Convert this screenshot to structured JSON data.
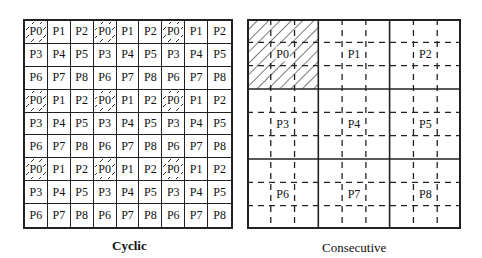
{
  "cyclic": {
    "caption": "Cyclic",
    "rows": [
      [
        "P0",
        "P1",
        "P2",
        "P0",
        "P1",
        "P2",
        "P0",
        "P1",
        "P2"
      ],
      [
        "P3",
        "P4",
        "P5",
        "P3",
        "P4",
        "P5",
        "P3",
        "P4",
        "P5"
      ],
      [
        "P6",
        "P7",
        "P8",
        "P6",
        "P7",
        "P8",
        "P6",
        "P7",
        "P8"
      ],
      [
        "P0",
        "P1",
        "P2",
        "P0",
        "P1",
        "P2",
        "P0",
        "P1",
        "P2"
      ],
      [
        "P3",
        "P4",
        "P5",
        "P3",
        "P4",
        "P5",
        "P3",
        "P4",
        "P5"
      ],
      [
        "P6",
        "P7",
        "P8",
        "P6",
        "P7",
        "P8",
        "P6",
        "P7",
        "P8"
      ],
      [
        "P0",
        "P1",
        "P2",
        "P0",
        "P1",
        "P2",
        "P0",
        "P1",
        "P2"
      ],
      [
        "P3",
        "P4",
        "P5",
        "P3",
        "P4",
        "P5",
        "P3",
        "P4",
        "P5"
      ],
      [
        "P6",
        "P7",
        "P8",
        "P6",
        "P7",
        "P8",
        "P6",
        "P7",
        "P8"
      ]
    ],
    "highlighted": "P0"
  },
  "consecutive": {
    "caption": "Consecutive",
    "blocks": [
      [
        "P0",
        "P1",
        "P2"
      ],
      [
        "P3",
        "P4",
        "P5"
      ],
      [
        "P6",
        "P7",
        "P8"
      ]
    ],
    "highlighted": "P0"
  }
}
